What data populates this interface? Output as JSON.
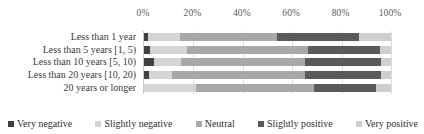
{
  "chart_data": {
    "type": "bar",
    "orientation": "horizontal",
    "stacked": true,
    "normalized": true,
    "title": "",
    "xlabel": "",
    "ylabel": "",
    "xlim": [
      0,
      100
    ],
    "grid": true,
    "legend_position": "bottom",
    "axis_ticks": [
      "0%",
      "20%",
      "40%",
      "60%",
      "80%",
      "100%"
    ],
    "axis_tick_values": [
      0,
      20,
      40,
      60,
      80,
      100
    ],
    "categories": [
      "Less than 1 year",
      "Less than 5 years [1, 5)",
      "Less than 10 years [5, 10)",
      "Less than 20 years [10, 20)",
      "20 years or longer"
    ],
    "series": [
      {
        "name": "Very negative",
        "color": "#404040",
        "values": [
          1.5,
          2.5,
          4.0,
          2.0,
          0.0
        ]
      },
      {
        "name": "Slightly negative",
        "color": "#d4d4d4",
        "values": [
          13.0,
          15.0,
          11.0,
          9.5,
          21.0
        ]
      },
      {
        "name": "Neutral",
        "color": "#a8a8a8",
        "values": [
          39.5,
          49.0,
          50.0,
          53.5,
          48.0
        ]
      },
      {
        "name": "Slightly positive",
        "color": "#5a5a5a",
        "values": [
          33.0,
          29.0,
          31.0,
          31.0,
          25.0
        ]
      },
      {
        "name": "Very positive",
        "color": "#cfcfcf",
        "values": [
          13.0,
          4.5,
          4.0,
          4.0,
          6.0
        ]
      }
    ]
  },
  "legend": {
    "items": [
      {
        "label": "Very negative",
        "color": "#404040"
      },
      {
        "label": "Slightly negative",
        "color": "#d4d4d4"
      },
      {
        "label": "Neutral",
        "color": "#a8a8a8"
      },
      {
        "label": "Slightly positive",
        "color": "#5a5a5a"
      },
      {
        "label": "Very positive",
        "color": "#cfcfcf"
      }
    ]
  }
}
